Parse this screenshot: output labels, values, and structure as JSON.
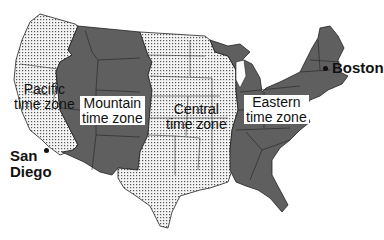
{
  "map": {
    "title": "US time zones",
    "colors": {
      "shaded_zone": "#5f5f5f",
      "dotted_zone_bg": "#f4f4f4",
      "dot": "#444444",
      "border": "#222222",
      "background": "#ffffff"
    },
    "zones": [
      {
        "id": "pacific",
        "line1": "Pacific",
        "line2": "time zone",
        "fill": "dotted"
      },
      {
        "id": "mountain",
        "line1": "Mountain",
        "line2": "time zone",
        "fill": "shaded"
      },
      {
        "id": "central",
        "line1": "Central",
        "line2": "time zone",
        "fill": "dotted"
      },
      {
        "id": "eastern",
        "line1": "Eastern",
        "line2": "time zone",
        "fill": "shaded"
      }
    ],
    "cities": [
      {
        "id": "san-diego",
        "line1": "San",
        "line2": "Diego"
      },
      {
        "id": "boston",
        "line1": "Boston"
      }
    ]
  }
}
